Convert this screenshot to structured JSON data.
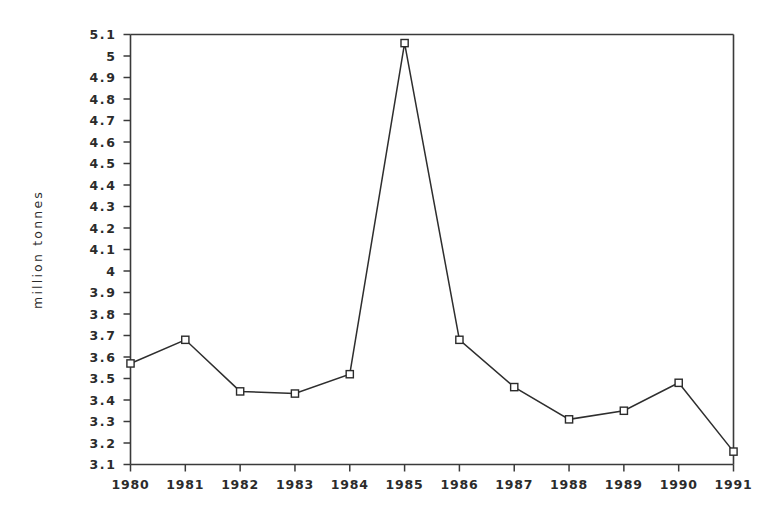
{
  "chart_data": {
    "type": "line",
    "title": "",
    "subtitle": "",
    "xlabel": "",
    "ylabel": "million tonnes",
    "x": [
      1980,
      1981,
      1982,
      1983,
      1984,
      1985,
      1986,
      1987,
      1988,
      1989,
      1990,
      1991
    ],
    "categories": [
      "1980",
      "1981",
      "1982",
      "1983",
      "1984",
      "1985",
      "1986",
      "1987",
      "1988",
      "1989",
      "1990",
      "1991"
    ],
    "values": [
      3.57,
      3.68,
      3.44,
      3.43,
      3.52,
      5.06,
      3.68,
      3.46,
      3.31,
      3.35,
      3.48,
      3.16
    ],
    "series": [
      {
        "name": "million tonnes",
        "values": [
          3.57,
          3.68,
          3.44,
          3.43,
          3.52,
          5.06,
          3.68,
          3.46,
          3.31,
          3.35,
          3.48,
          3.16
        ]
      }
    ],
    "xlim": [
      1980,
      1991
    ],
    "ylim": [
      3.1,
      5.1
    ],
    "ytick_values": [
      3.1,
      3.2,
      3.3,
      3.4,
      3.5,
      3.6,
      3.7,
      3.8,
      3.9,
      4.0,
      4.1,
      4.2,
      4.3,
      4.4,
      4.5,
      4.6,
      4.7,
      4.8,
      4.9,
      5.0,
      5.1
    ],
    "ytick_labels": [
      "3.1",
      "3.2",
      "3.3",
      "3.4",
      "3.5",
      "3.6",
      "3.7",
      "3.8",
      "3.9",
      "4",
      "4.1",
      "4.2",
      "4.3",
      "4.4",
      "4.5",
      "4.6",
      "4.7",
      "4.8",
      "4.9",
      "5",
      "5.1"
    ],
    "xtick_labels": [
      "1980",
      "1981",
      "1982",
      "1983",
      "1984",
      "1985",
      "1986",
      "1987",
      "1988",
      "1989",
      "1990",
      "1991"
    ],
    "grid": false,
    "legend": "none",
    "marker": "open-square",
    "line_color": "#2e2e2e",
    "marker_fill": "#ffffff",
    "marker_stroke": "#2b2b2b",
    "axis_color": "#3a3a3a",
    "background": "#ffffff"
  }
}
